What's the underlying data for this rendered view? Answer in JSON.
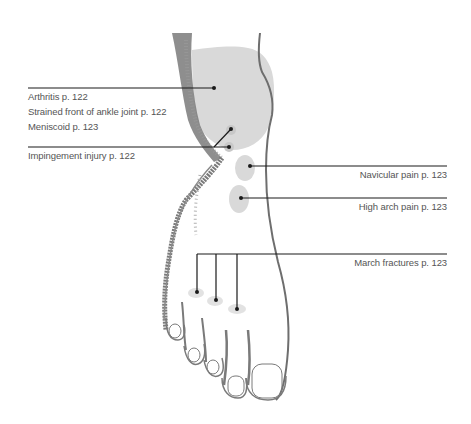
{
  "diagram": {
    "colors": {
      "background": "#ffffff",
      "outline": "#6e6e6e",
      "shading": "#7a7a7a",
      "injury_area": "#d9d9d9",
      "leader_line": "#1a1a1a",
      "label_text": "#555555"
    },
    "labels_left": [
      {
        "id": "arthritis",
        "text": "Arthritis p. 122"
      },
      {
        "id": "strained",
        "text": "Strained front of ankle joint p. 122"
      },
      {
        "id": "meniscoid",
        "text": "Meniscoid p. 123"
      },
      {
        "id": "impingement",
        "text": "Impingement injury p. 122"
      }
    ],
    "labels_right": [
      {
        "id": "navicular",
        "text": "Navicular pain p. 123"
      },
      {
        "id": "high-arch",
        "text": "High arch pain p. 123"
      },
      {
        "id": "march",
        "text": "March fractures p. 123"
      }
    ]
  }
}
